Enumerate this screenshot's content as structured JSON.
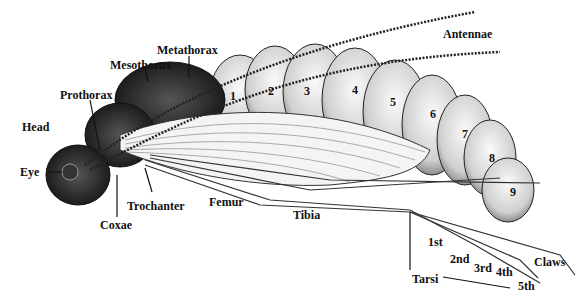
{
  "diagram": {
    "labels": {
      "head": "Head",
      "eye": "Eye",
      "prothorax": "Prothorax",
      "mesothorax": "Mesothorax",
      "metathorax": "Metathorax",
      "antennae": "Antennae",
      "coxae": "Coxae",
      "trochanter": "Trochanter",
      "femur": "Femur",
      "tibia": "Tibia",
      "tarsi": "Tarsi",
      "claws": "Claws",
      "tarsal_segments": [
        "1st",
        "2nd",
        "3rd",
        "4th",
        "5th"
      ]
    },
    "abdominal_segments": [
      "1",
      "2",
      "3",
      "4",
      "5",
      "6",
      "7",
      "8",
      "9"
    ],
    "colors": {
      "ink": "#111111",
      "background": "#ffffff",
      "body_shade": "#d8d8d8",
      "dark_thorax": "#2a2a2a"
    }
  }
}
